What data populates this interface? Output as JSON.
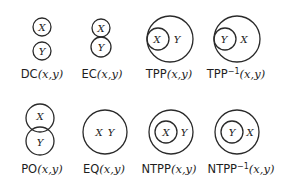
{
  "colors": {
    "stroke": "#2a2a2a",
    "text": "#1e1e1e",
    "background": "#ffffff"
  },
  "relations": [
    {
      "id": "DC",
      "name": "DC",
      "sup": "",
      "args": "(x,y)",
      "var_a": "X",
      "var_b": "Y"
    },
    {
      "id": "EC",
      "name": "EC",
      "sup": "",
      "args": "(x,y)",
      "var_a": "X",
      "var_b": "Y"
    },
    {
      "id": "TPP",
      "name": "TPP",
      "sup": "",
      "args": "(x,y)",
      "var_a": "X",
      "var_b": "Y"
    },
    {
      "id": "TPPi",
      "name": "TPP",
      "sup": "−1",
      "args": "(x,y)",
      "var_a": "Y",
      "var_b": "X"
    },
    {
      "id": "PO",
      "name": "PO",
      "sup": "",
      "args": "(x,y)",
      "var_a": "X",
      "var_b": "Y"
    },
    {
      "id": "EQ",
      "name": "EQ",
      "sup": "",
      "args": "(x,y)",
      "var_a": "X",
      "var_b": "Y"
    },
    {
      "id": "NTPP",
      "name": "NTPP",
      "sup": "",
      "args": "(x,y)",
      "var_a": "X",
      "var_b": "Y"
    },
    {
      "id": "NTPPi",
      "name": "NTPP",
      "sup": "−1",
      "args": "(x,y)",
      "var_a": "Y",
      "var_b": "X"
    }
  ]
}
